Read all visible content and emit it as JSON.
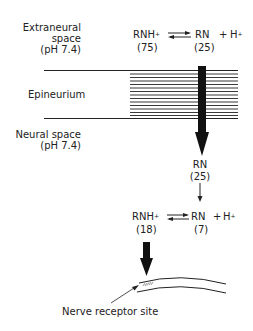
{
  "regions": {
    "extraneural": {
      "line1": "Extraneural",
      "line2": "space",
      "line3": "(pH 7.4)"
    },
    "epineurium": {
      "label": "Epineurium"
    },
    "neural": {
      "line1": "Neural space",
      "line2": "(pH 7.4)"
    }
  },
  "equilibrium_top": {
    "left_species": "RNH",
    "left_charge": "+",
    "left_value": "(75)",
    "right_species": "RN",
    "plus": "+",
    "proton": "H",
    "proton_charge": "+",
    "right_value": "(25)"
  },
  "diffused": {
    "species": "RN",
    "value": "(25)"
  },
  "equilibrium_bottom": {
    "left_species": "RNH",
    "left_charge": "+",
    "left_value": "(18)",
    "right_species": "RN",
    "plus": "+",
    "proton": "H",
    "proton_charge": "+",
    "right_value": "(7)"
  },
  "receptor": {
    "label": "Nerve receptor site"
  },
  "colors": {
    "ink": "#1a1a1a",
    "background": "#ffffff"
  }
}
